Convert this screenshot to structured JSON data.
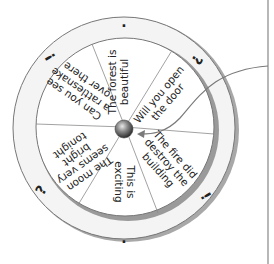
{
  "diagram": {
    "segments": [
      {
        "id": "s1",
        "lines": [
          "The forest is",
          "beautiful"
        ],
        "angle": -90
      },
      {
        "id": "s2",
        "lines": [
          "Will you open",
          "the door"
        ],
        "angle": -45
      },
      {
        "id": "s3",
        "lines": [
          "The fire did",
          "destroy the",
          "building"
        ],
        "angle": 50
      },
      {
        "id": "s4",
        "lines": [
          "This is",
          "exciting"
        ],
        "angle": 100
      },
      {
        "id": "s5",
        "lines": [
          "The moon",
          "seems very",
          "bright",
          "tonight"
        ],
        "angle": 150
      },
      {
        "id": "s6",
        "lines": [
          "Can you see",
          "a rattlesnake",
          "over there"
        ],
        "angle": 235
      }
    ],
    "outer_marks": [
      {
        "id": "top",
        "symbol": ".",
        "x": 124,
        "y": 22,
        "rot": 0
      },
      {
        "id": "upper-right",
        "symbol": "?",
        "x": 197,
        "y": 60,
        "rot": 120
      },
      {
        "id": "lower-right",
        "symbol": "!",
        "x": 206,
        "y": 196,
        "rot": 60
      },
      {
        "id": "bottom",
        "symbol": ".",
        "x": 124,
        "y": 238,
        "rot": 0
      },
      {
        "id": "lower-left",
        "symbol": "?",
        "x": 41,
        "y": 190,
        "rot": -60
      },
      {
        "id": "upper-left",
        "symbol": "!",
        "x": 50,
        "y": 57,
        "rot": -120
      }
    ],
    "colors": {
      "ring_fill": "#f4f4f4",
      "ring_stroke": "#777777",
      "disc_fill": "#ffffff",
      "shadow": "#9a9a9a",
      "divider": "#8a8a8a",
      "text": "#222222",
      "arrow": "#7a7a7a",
      "panel_line": "#888888"
    }
  }
}
